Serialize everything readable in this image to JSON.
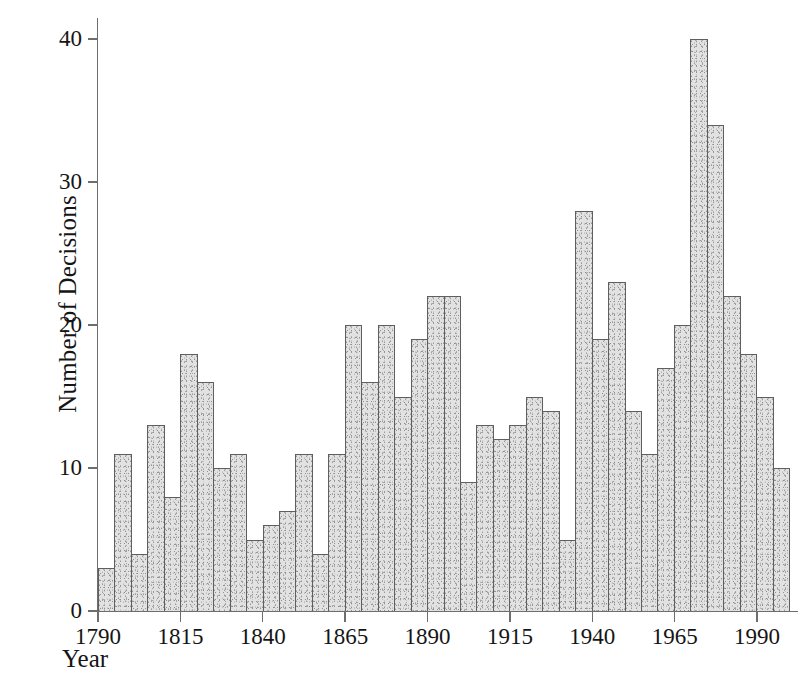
{
  "chart_data": {
    "type": "bar",
    "title": "",
    "subtitle": "",
    "xlabel": "Year",
    "ylabel": "Number of Decisions",
    "xlim": [
      1790,
      2000
    ],
    "ylim": [
      0,
      42
    ],
    "bin_width_years": 5,
    "grid": false,
    "legend": null,
    "y_ticks": [
      0,
      10,
      20,
      30,
      40
    ],
    "y_tick_labels": [
      "0",
      "10",
      "20",
      "30",
      "40"
    ],
    "x_ticks": [
      1790,
      1815,
      1840,
      1865,
      1890,
      1915,
      1940,
      1965,
      1990
    ],
    "x_tick_labels": [
      "1790",
      "1815",
      "1840",
      "1865",
      "1890",
      "1915",
      "1940",
      "1965",
      "1990"
    ],
    "categories": [
      "1790",
      "1795",
      "1800",
      "1805",
      "1810",
      "1815",
      "1820",
      "1825",
      "1830",
      "1835",
      "1840",
      "1845",
      "1850",
      "1855",
      "1860",
      "1865",
      "1870",
      "1875",
      "1880",
      "1885",
      "1890",
      "1895",
      "1900",
      "1905",
      "1910",
      "1915",
      "1920",
      "1925",
      "1930",
      "1935",
      "1940",
      "1945",
      "1950",
      "1955",
      "1960",
      "1965",
      "1970",
      "1975",
      "1980",
      "1985",
      "1990",
      "1995"
    ],
    "values": [
      3,
      11,
      4,
      13,
      8,
      18,
      16,
      10,
      11,
      5,
      6,
      7,
      11,
      4,
      11,
      20,
      16,
      20,
      15,
      19,
      22,
      22,
      9,
      13,
      12,
      13,
      15,
      14,
      5,
      28,
      19,
      23,
      14,
      11,
      17,
      20,
      40,
      34,
      22,
      18,
      15,
      10
    ],
    "bar_fill_color": "#e2e2e2",
    "bar_edge_color": "#5f5f5f",
    "axis_color": "#6e6e6e"
  }
}
